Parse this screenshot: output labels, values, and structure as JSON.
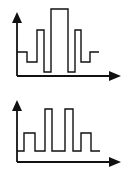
{
  "colors": {
    "stroke": "#111111",
    "background": "#ffffff"
  },
  "diagrams": [
    {
      "name": "waveform-top",
      "description": "Symmetric pulse train with tallest central pulse",
      "axis": {
        "origin": [
          17,
          76
        ],
        "y_tip": [
          17,
          12
        ],
        "x_tip": [
          120,
          76
        ]
      },
      "path": [
        [
          17,
          52
        ],
        [
          27,
          52
        ],
        [
          27,
          62
        ],
        [
          37,
          62
        ],
        [
          37,
          30
        ],
        [
          44,
          30
        ],
        [
          44,
          72
        ],
        [
          51,
          72
        ],
        [
          51,
          9
        ],
        [
          68,
          9
        ],
        [
          68,
          72
        ],
        [
          75,
          72
        ],
        [
          75,
          30
        ],
        [
          81,
          30
        ],
        [
          81,
          62
        ],
        [
          90,
          62
        ],
        [
          90,
          52
        ],
        [
          99,
          52
        ]
      ]
    },
    {
      "name": "waveform-bottom",
      "description": "Pulse train with two tall center pulses and two short outer pulses",
      "axis": {
        "origin": [
          17,
          72
        ],
        "y_tip": [
          17,
          10
        ],
        "x_tip": [
          120,
          72
        ]
      },
      "path": [
        [
          17,
          61
        ],
        [
          24,
          61
        ],
        [
          24,
          43
        ],
        [
          35,
          43
        ],
        [
          35,
          61
        ],
        [
          45,
          61
        ],
        [
          45,
          19
        ],
        [
          52,
          19
        ],
        [
          52,
          61
        ],
        [
          65,
          61
        ],
        [
          65,
          19
        ],
        [
          73,
          19
        ],
        [
          73,
          61
        ],
        [
          81,
          61
        ],
        [
          81,
          43
        ],
        [
          91,
          43
        ],
        [
          91,
          61
        ],
        [
          100,
          61
        ]
      ]
    }
  ]
}
